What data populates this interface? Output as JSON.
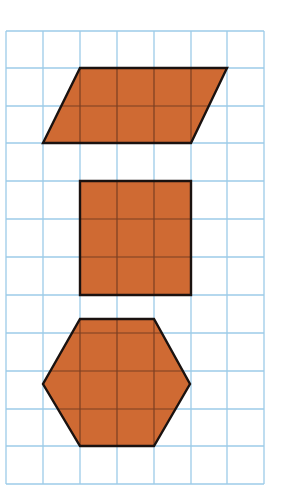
{
  "figure": {
    "width": 298,
    "height": 499,
    "background": "#ffffff",
    "grid": {
      "columns": 7,
      "rows": 12,
      "x_lines": [
        6,
        43,
        80,
        117,
        154,
        191,
        227,
        264
      ],
      "y_lines": [
        31,
        68,
        106,
        143,
        181,
        219,
        257,
        295,
        333,
        371,
        409,
        446,
        484
      ],
      "line_color": "#9ccbe8",
      "line_width": 1.3
    },
    "shape_style": {
      "fill": "#cf6a33",
      "stroke": "#1a1210",
      "stroke_width": 2.4,
      "inner_grid_color": "#7a3e22"
    },
    "shapes": [
      {
        "name": "parallelogram",
        "points": [
          [
            80,
            68
          ],
          [
            227,
            68
          ],
          [
            191,
            143
          ],
          [
            43,
            143
          ]
        ]
      },
      {
        "name": "square",
        "points": [
          [
            80,
            181
          ],
          [
            191,
            181
          ],
          [
            191,
            295
          ],
          [
            80,
            295
          ]
        ]
      },
      {
        "name": "hexagon",
        "points": [
          [
            80,
            319
          ],
          [
            154,
            319
          ],
          [
            190,
            384
          ],
          [
            154,
            446
          ],
          [
            80,
            446
          ],
          [
            43,
            384
          ]
        ]
      }
    ]
  }
}
